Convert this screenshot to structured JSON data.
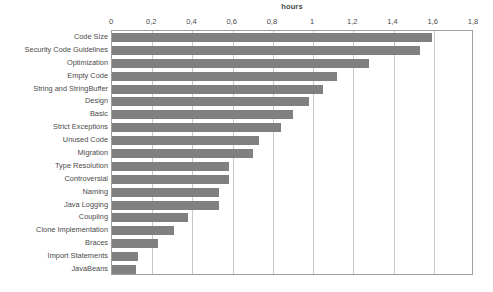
{
  "chart_data": {
    "type": "bar",
    "orientation": "horizontal",
    "title": "hours",
    "xlabel": "",
    "ylabel": "",
    "xlim": [
      0,
      1.8
    ],
    "xticks": [
      "0",
      "0,2",
      "0,4",
      "0,6",
      "0,8",
      "1",
      "1,2",
      "1,4",
      "1,6",
      "1,8"
    ],
    "xtick_values": [
      0,
      0.2,
      0.4,
      0.6,
      0.8,
      1.0,
      1.2,
      1.4,
      1.6,
      1.8
    ],
    "grid": true,
    "legend": false,
    "bar_color": "#808080",
    "gridline_color": "#c9c9c9",
    "axis_color": "#9e9e9e",
    "categories": [
      "Code Size",
      "Security Code Guidelines",
      "Optimization",
      "Empty Code",
      "String and StringBuffer",
      "Design",
      "Basic",
      "Strict Exceptions",
      "Unused Code",
      "Migration",
      "Type Resolution",
      "Controversial",
      "Naming",
      "Java Logging",
      "Coupling",
      "Clone Implementation",
      "Braces",
      "Import Statements",
      "JavaBeans"
    ],
    "values": [
      1.59,
      1.53,
      1.28,
      1.12,
      1.05,
      0.98,
      0.9,
      0.84,
      0.73,
      0.7,
      0.58,
      0.58,
      0.53,
      0.53,
      0.38,
      0.31,
      0.23,
      0.13,
      0.12
    ]
  }
}
